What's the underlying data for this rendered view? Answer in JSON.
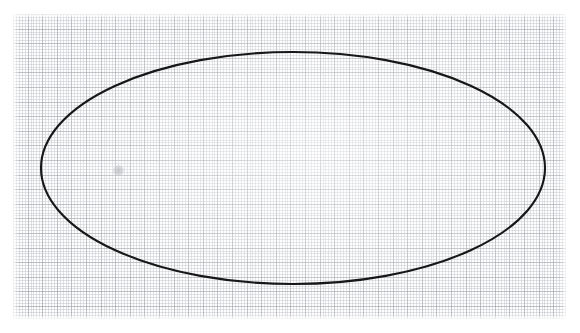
{
  "image": {
    "kind": "scanned-graph-paper-figure",
    "width": 580,
    "height": 333,
    "background_color": "#ffffff",
    "caption": ""
  },
  "paper": {
    "name": "graph-paper-sheet",
    "left": 13,
    "top": 14,
    "width": 553,
    "height": 305,
    "paper_color": "#fefefe",
    "minor_grid_color": "#a8acb4",
    "minor_grid_spacing_px": 2.92,
    "major_grid_color": "#969aa0",
    "major_grid_spacing_px": 14.6,
    "minor_cells_per_major": 5
  },
  "chart_data": {
    "type": "scatter",
    "title": "",
    "subtitle": "",
    "xlabel": "",
    "ylabel": "",
    "grid": true,
    "legend_position": "none",
    "xlim": [
      13,
      566
    ],
    "ylim": [
      14,
      319
    ],
    "annotations": [
      {
        "name": "ellipse-outline",
        "shape": "ellipse",
        "center_x": 293,
        "center_y": 168,
        "radius_x": 252,
        "radius_y": 116,
        "rotation_deg": 0,
        "stroke_color": "#171717",
        "stroke_width": 2.1,
        "fill": "none",
        "extremes": {
          "left_x": 41,
          "right_x": 545,
          "top_y": 52,
          "bottom_y": 284
        }
      },
      {
        "name": "pencil-smudge",
        "shape": "dot",
        "center_x": 118,
        "center_y": 170,
        "diameter": 11,
        "color": "#b9bcc0"
      }
    ],
    "series": [],
    "values": []
  }
}
